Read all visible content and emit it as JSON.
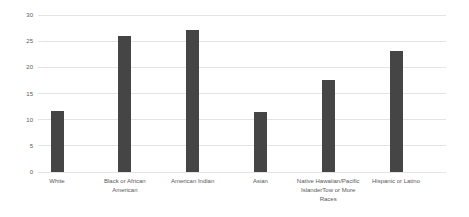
{
  "chart_data": {
    "type": "bar",
    "title": "",
    "xlabel": "",
    "ylabel": "",
    "categories": [
      "White",
      "Black or African American",
      "American Indian",
      "Asian",
      "Native Hawaiian/Pacific IslanderTow or More Races",
      "Hispanic or Latino"
    ],
    "category_label_lines": [
      [
        "White"
      ],
      [
        "Black or African",
        "American"
      ],
      [
        "American Indian"
      ],
      [
        "Asian"
      ],
      [
        "Native Hawaiian/Pacific",
        "IslanderTow or More",
        "Races"
      ],
      [
        "Hispanic or Latino"
      ]
    ],
    "values": [
      11.6,
      25.9,
      27.1,
      11.5,
      17.5,
      23.1
    ],
    "ylim": [
      0,
      30
    ],
    "yticks": [
      0,
      5,
      10,
      15,
      20,
      25,
      30
    ],
    "grid": true,
    "legend": false,
    "colors": {
      "bar": "#454545",
      "gridline": "#e4e4e4",
      "label_text": "#595959",
      "background": "#ffffff"
    }
  }
}
